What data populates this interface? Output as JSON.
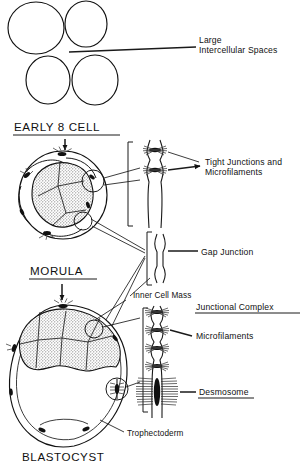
{
  "figure": {
    "type": "scientific-diagram",
    "background_color": "#ffffff",
    "ink_color": "#111111",
    "stipple_fill_color": "#9a9a9a"
  },
  "stages": [
    {
      "id": "four-cell",
      "heading": "",
      "description": "Four loosely apposed blastomeres drawn as open circles with large gaps between them"
    },
    {
      "id": "early-8-cell",
      "heading": "EARLY 8 CELL",
      "underlined": true,
      "description": "Compacting embryo; outer blastomeres with stippled inner cytoplasm and junction sites"
    },
    {
      "id": "morula",
      "heading": "MORULA",
      "underlined": true,
      "description": "Fully compacted cell mass"
    },
    {
      "id": "blastocyst",
      "heading": "BLASTOCYST",
      "underlined": false,
      "cropped": true,
      "description": "Cavitated embryo with inner cell mass and trophectoderm enclosing blastocoel"
    }
  ],
  "labels": {
    "large_intercellular_spaces": {
      "line1": "Large",
      "line2": "Intercellular Spaces"
    },
    "tight_junctions": {
      "line1": "Tight Junctions and",
      "line2": "Microfilaments"
    },
    "gap_junction": "Gap Junction",
    "inner_cell_mass": "Inner Cell Mass",
    "junctional_complex": "Junctional Complex",
    "microfilaments": "Microfilaments",
    "desmosome": "Desmosome",
    "trophectoderm": "Trophectoderm"
  },
  "underlined_labels": [
    "EARLY 8 CELL",
    "MORULA",
    "Junctional Complex",
    "Desmosome"
  ],
  "junction_insets": [
    {
      "id": "tight-junction-inset",
      "units": 2,
      "has_filaments": true,
      "bracket": true
    },
    {
      "id": "gap-junction-inset",
      "units": 0,
      "has_filaments": false,
      "bracket": true
    },
    {
      "id": "junctional-complex-inset",
      "units": 4,
      "has_filaments": true,
      "bracket": true
    },
    {
      "id": "desmosome-inset",
      "units": 1,
      "has_filaments": true,
      "bracket": true
    }
  ]
}
